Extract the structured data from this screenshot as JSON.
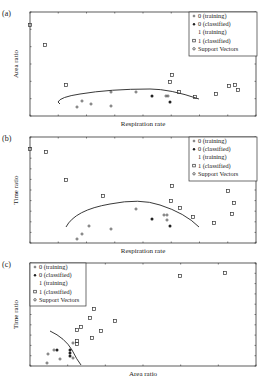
{
  "chart_data": [
    {
      "panel": "(a)",
      "type": "scatter",
      "xlabel": "Respiration rate",
      "ylabel": "Area ratio",
      "legend": [
        "0 (training)",
        "0 (classified)",
        "1 (training)",
        "1 (classified)",
        "Support Vectors"
      ],
      "legend_position": "upper right",
      "box": [
        30,
        12,
        256,
        116
      ],
      "xticks": 8,
      "yticks": 6,
      "series": [
        {
          "name": "1 (classified)",
          "marker": "square",
          "points": [
            [
              30,
              25
            ],
            [
              45,
              45
            ],
            [
              66,
              85
            ],
            [
              170,
              82
            ],
            [
              172,
              75
            ],
            [
              179,
              92
            ],
            [
              195,
              97
            ],
            [
              216,
              94
            ],
            [
              229,
              86
            ],
            [
              235,
              85
            ],
            [
              238,
              90
            ]
          ]
        },
        {
          "name": "0 (training)",
          "marker": "plus",
          "points": [
            [
              82,
              101
            ],
            [
              77,
              107
            ],
            [
              91,
              104
            ],
            [
              111,
              92
            ],
            [
              111,
              106
            ],
            [
              136,
              92
            ],
            [
              166,
              96
            ],
            [
              168,
              96
            ]
          ]
        },
        {
          "name": "0 (classified)",
          "marker": "star",
          "points": [
            [
              152,
              96
            ],
            [
              170,
              102
            ]
          ]
        }
      ],
      "boundary": "M60,104 L58,102 Q60,97 80,94 Q110,89 150,89 Q170,89 199,99"
    },
    {
      "panel": "(b)",
      "type": "scatter",
      "xlabel": "Respiration rate",
      "ylabel": "Time ratio",
      "legend": [
        "0 (training)",
        "0 (classified)",
        "1 (training)",
        "1 (classified)",
        "Support Vectors"
      ],
      "legend_position": "upper right",
      "box": [
        30,
        137,
        256,
        243
      ],
      "xticks": 8,
      "yticks": 10,
      "series": [
        {
          "name": "1 (classified)",
          "marker": "square",
          "points": [
            [
              30,
              149
            ],
            [
              46,
              152
            ],
            [
              66,
              180
            ],
            [
              103,
              196
            ],
            [
              172,
              186
            ],
            [
              171,
              201
            ],
            [
              180,
              208
            ],
            [
              193,
              217
            ],
            [
              214,
              223
            ],
            [
              228,
              191
            ],
            [
              234,
              203
            ],
            [
              232,
              214
            ]
          ]
        },
        {
          "name": "0 (training)",
          "marker": "plus",
          "points": [
            [
              77,
              239
            ],
            [
              82,
              234
            ],
            [
              89,
              226
            ],
            [
              111,
              229
            ],
            [
              136,
              209
            ],
            [
              164,
              215
            ],
            [
              167,
              220
            ],
            [
              167,
              215
            ]
          ]
        },
        {
          "name": "0 (classified)",
          "marker": "star",
          "points": [
            [
              152,
              219
            ],
            [
              170,
              226
            ]
          ]
        }
      ],
      "boundary": "M66,227 Q75,210 110,204 Q140,198 160,205 Q185,213 199,227"
    },
    {
      "panel": "(c)",
      "type": "scatter",
      "xlabel": "Area ratio",
      "ylabel": "Time ratio",
      "legend": [
        "0 (training)",
        "0 (classified)",
        "1 (training)",
        "1 (classified)",
        "Support Vectors"
      ],
      "legend_position": "upper left",
      "box": [
        30,
        263,
        256,
        366
      ],
      "xticks": 6,
      "yticks": 10,
      "series": [
        {
          "name": "1 (classified)",
          "marker": "square",
          "points": [
            [
              180,
              276
            ],
            [
              225,
              273
            ],
            [
              94,
              309
            ],
            [
              90,
              318
            ],
            [
              77,
              330
            ],
            [
              81,
              327
            ],
            [
              101,
              331
            ],
            [
              92,
              338
            ],
            [
              115,
              321
            ],
            [
              77,
              341
            ],
            [
              77,
              344
            ]
          ]
        },
        {
          "name": "0 (training)",
          "marker": "plus",
          "points": [
            [
              47,
              363
            ],
            [
              48,
              354
            ],
            [
              54,
              350
            ],
            [
              60,
              359
            ],
            [
              73,
              358
            ],
            [
              73,
              343
            ]
          ]
        },
        {
          "name": "0 (classified)",
          "marker": "star",
          "points": [
            [
              57,
              350
            ],
            [
              70,
              350
            ],
            [
              70,
              353
            ],
            [
              70,
              356
            ]
          ]
        }
      ],
      "boundary": "M50,331 Q65,338 72,350 Q77,360 81,365"
    }
  ]
}
